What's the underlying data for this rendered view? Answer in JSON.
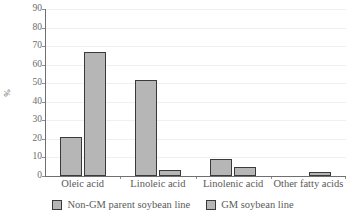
{
  "chart_data": {
    "type": "bar",
    "title": "",
    "subtitle": "",
    "xlabel": "",
    "ylabel": "%",
    "ylim": [
      0,
      90
    ],
    "ytick_step": 10,
    "yticks": [
      0,
      10,
      20,
      30,
      40,
      50,
      60,
      70,
      80,
      90
    ],
    "yticklabels": [
      "0",
      "10",
      "20",
      "30",
      "40",
      "50",
      "60",
      "70",
      "80",
      "90"
    ],
    "grid": "horizontal-faint",
    "legend_position": "bottom-center",
    "categories": [
      "Oleic acid",
      "Linoleic acid",
      "Linolenic acid",
      "Other fatty acids"
    ],
    "series": [
      {
        "name": "Non-GM parent soybean line",
        "values": [
          21,
          52,
          9,
          0
        ],
        "color": "#b6b6b6",
        "edge_color": "#3a3a3a"
      },
      {
        "name": "GM soybean line",
        "values": [
          67,
          3,
          5,
          2
        ],
        "color": "#b6b6b6",
        "edge_color": "#3a3a3a"
      }
    ],
    "annotations": []
  },
  "legend": {
    "items": [
      {
        "label": "Non-GM parent soybean line"
      },
      {
        "label": "GM soybean line"
      }
    ]
  },
  "colors": {
    "bar_fill": "#b6b6b6",
    "bar_edge": "#3a3a3a",
    "axis": "#6f6f6f",
    "gridline": "#f0f0f2",
    "text": "#5a5a5a",
    "background": "#ffffff"
  }
}
